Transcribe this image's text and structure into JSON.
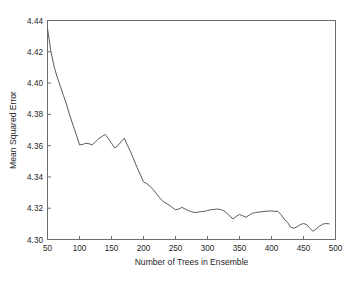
{
  "chart_data": {
    "type": "line",
    "title": "",
    "xlabel": "Number of Trees in Ensemble",
    "ylabel": "Mean Squared Error",
    "xlim": [
      50,
      500
    ],
    "ylim": [
      4.3,
      4.44
    ],
    "xticks": [
      50,
      100,
      150,
      200,
      250,
      300,
      350,
      400,
      450,
      500
    ],
    "xtick_labels": [
      "50",
      "100",
      "150",
      "200",
      "250",
      "300",
      "350",
      "400",
      "450",
      "500"
    ],
    "yticks": [
      4.3,
      4.32,
      4.34,
      4.36,
      4.38,
      4.4,
      4.42,
      4.44
    ],
    "ytick_labels": [
      "4.30",
      "4.32",
      "4.34",
      "4.36",
      "4.38",
      "4.40",
      "4.42",
      "4.44"
    ],
    "grid": false,
    "legend": null,
    "line_color": "#5a5a5a",
    "frame_color": "#6d6d6d",
    "background_color": "#ffffff",
    "series": [
      {
        "name": "Mean Squared Error",
        "x": [
          50,
          55,
          60,
          65,
          70,
          75,
          80,
          85,
          90,
          95,
          100,
          105,
          110,
          115,
          120,
          125,
          130,
          135,
          140,
          145,
          150,
          155,
          160,
          165,
          170,
          175,
          180,
          185,
          190,
          195,
          200,
          205,
          210,
          215,
          220,
          225,
          230,
          235,
          240,
          245,
          250,
          255,
          260,
          265,
          270,
          275,
          280,
          285,
          290,
          295,
          300,
          305,
          310,
          315,
          320,
          325,
          330,
          335,
          340,
          345,
          350,
          355,
          360,
          365,
          370,
          375,
          380,
          385,
          390,
          395,
          400,
          405,
          410,
          415,
          420,
          425,
          430,
          435,
          440,
          445,
          450,
          455,
          460,
          465,
          470,
          475,
          480,
          485,
          490
        ],
        "y": [
          4.435,
          4.421,
          4.411,
          4.404,
          4.398,
          4.392,
          4.386,
          4.379,
          4.373,
          4.367,
          4.3605,
          4.3608,
          4.3615,
          4.3612,
          4.3605,
          4.3625,
          4.3645,
          4.3658,
          4.3672,
          4.3645,
          4.3615,
          4.3585,
          4.36,
          4.3625,
          4.3648,
          4.36,
          4.356,
          4.351,
          4.346,
          4.3415,
          4.3368,
          4.3358,
          4.334,
          4.332,
          4.3295,
          4.3268,
          4.3245,
          4.3232,
          4.322,
          4.3205,
          4.319,
          4.3195,
          4.3205,
          4.3195,
          4.3185,
          4.3178,
          4.3172,
          4.3175,
          4.3178,
          4.318,
          4.3185,
          4.319,
          4.3192,
          4.3195,
          4.3192,
          4.3185,
          4.317,
          4.3148,
          4.3132,
          4.3148,
          4.316,
          4.3152,
          4.3142,
          4.3155,
          4.3168,
          4.3172,
          4.3175,
          4.3178,
          4.318,
          4.3182,
          4.3182,
          4.318,
          4.318,
          4.3158,
          4.313,
          4.311,
          4.3078,
          4.3072,
          4.3082,
          4.3095,
          4.3102,
          4.3095,
          4.3072,
          4.3052,
          4.3068,
          4.3085,
          4.3098,
          4.3102,
          4.31
        ]
      }
    ]
  }
}
